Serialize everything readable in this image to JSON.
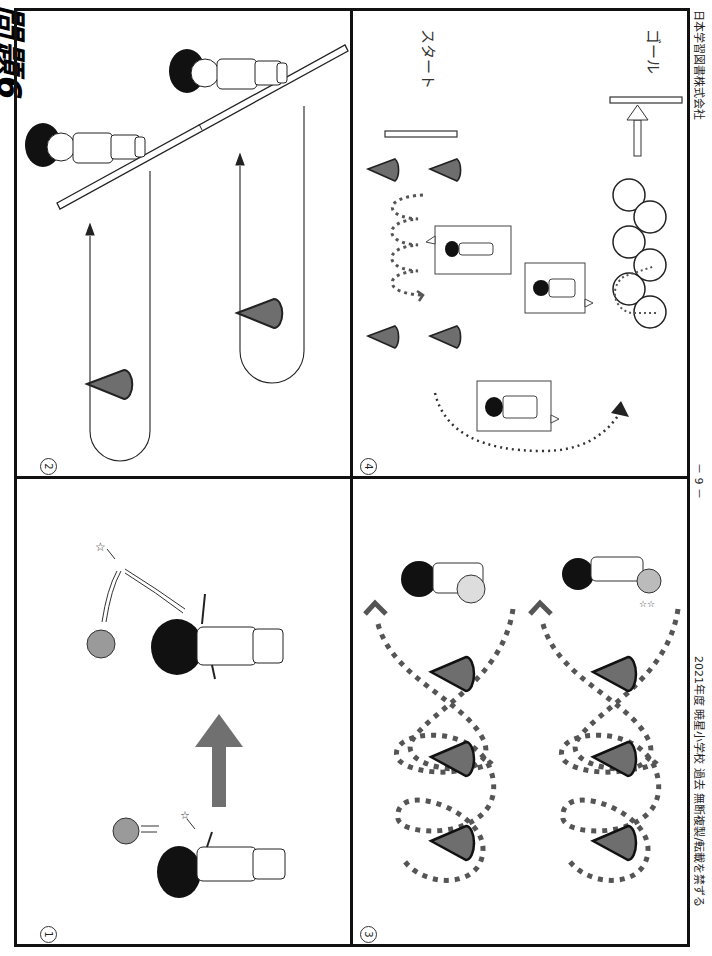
{
  "page": {
    "heading": "問題6",
    "orientation": "rotated 90° clockwise"
  },
  "panels": [
    {
      "id": "1",
      "label": "①",
      "description": "Catch ball thrown upward, then throw it up again"
    },
    {
      "id": "2",
      "label": "②",
      "description": "Run around cone and return across balance line"
    },
    {
      "id": "3",
      "label": "③",
      "description": "Dribble ball in figure-eight around three cones"
    },
    {
      "id": "4",
      "label": "④",
      "description": "Circuit from start to goal: zigzag, crawl, hoops"
    }
  ],
  "panel4": {
    "start_label": "スタート",
    "goal_label": "ゴール"
  },
  "footer": {
    "left": "2021年度 暁星小学校 過去 無断複製/転載を禁ずる",
    "center": "－ 9 －",
    "right": "日本学習図書株式会社"
  },
  "colors": {
    "border": "#111111",
    "cone": "#6e6e6e",
    "arrow": "#707070",
    "dots": "#555555",
    "ball": "#9a9a9a"
  }
}
